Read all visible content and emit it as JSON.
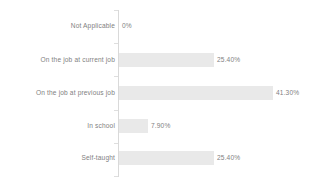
{
  "chart_data": {
    "type": "bar",
    "orientation": "horizontal",
    "title": "",
    "subtitle": "",
    "xlabel": "",
    "ylabel": "",
    "grid": false,
    "legend": false,
    "legend_position": "none",
    "axis_range": [
      0,
      41.3
    ],
    "categories": [
      "Not Applicable",
      "On the job at current job",
      "On the job at previous job",
      "In school",
      "Self-taught"
    ],
    "values": [
      0,
      25.4,
      41.3,
      7.9,
      25.4
    ],
    "value_labels": [
      "0%",
      "25.40%",
      "41.30%",
      "7.90%",
      "25.40%"
    ],
    "colors": {
      "bar": "#e9e9e9",
      "text": "#7f7f7f",
      "axis": "#d9d9d9",
      "background": "#ffffff"
    }
  },
  "rows": [
    {
      "label": "Not Applicable",
      "value": 0,
      "value_label": "0%",
      "bar_width_px": 0,
      "top_px": 19,
      "value_left_px": 122
    },
    {
      "label": "On the job at current job",
      "value": 25.4,
      "value_label": "25.40%",
      "bar_width_px": 95,
      "top_px": 53,
      "value_left_px": 217
    },
    {
      "label": "On the job at previous job",
      "value": 41.3,
      "value_label": "41.30%",
      "bar_width_px": 154,
      "top_px": 86,
      "value_left_px": 276
    },
    {
      "label": "In school",
      "value": 7.9,
      "value_label": "7.90%",
      "bar_width_px": 29,
      "top_px": 119,
      "value_left_px": 151
    },
    {
      "label": "Self-taught",
      "value": 25.4,
      "value_label": "25.40%",
      "bar_width_px": 95,
      "top_px": 151,
      "value_left_px": 217
    }
  ],
  "ticks": [
    10,
    43,
    76,
    110,
    143,
    176
  ]
}
